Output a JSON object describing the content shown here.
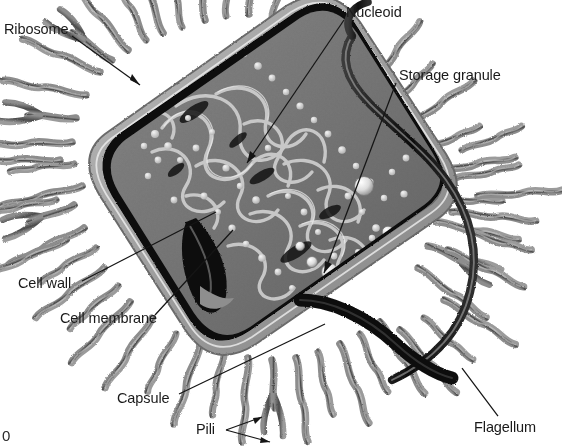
{
  "figure": {
    "background_color": "#ffffff",
    "ink_color": "#1a1a1a",
    "corner_mark": "0"
  },
  "labels": [
    {
      "id": "ribosome",
      "text": "Ribosome",
      "x": 4,
      "y": 22,
      "leader": {
        "x1": 72,
        "y1": 36,
        "x2": 140,
        "y2": 85
      },
      "arrow": true
    },
    {
      "id": "nucleoid",
      "text": "Nucleoid",
      "x": 346,
      "y": 5,
      "leader": {
        "x1": 344,
        "y1": 20,
        "x2": 247,
        "y2": 163
      },
      "arrow": true
    },
    {
      "id": "storage-granule",
      "text": "Storage granule",
      "x": 399,
      "y": 68,
      "leader": {
        "x1": 396,
        "y1": 83,
        "x2": 324,
        "y2": 273
      },
      "arrow": true
    },
    {
      "id": "cell-wall",
      "text": "Cell wall",
      "x": 18,
      "y": 276,
      "leader": {
        "x1": 82,
        "y1": 281,
        "x2": 216,
        "y2": 212
      },
      "arrow": false
    },
    {
      "id": "cell-membrane",
      "text": "Cell membrane",
      "x": 60,
      "y": 311,
      "leader": {
        "x1": 155,
        "y1": 315,
        "x2": 233,
        "y2": 230
      },
      "arrow": false
    },
    {
      "id": "capsule",
      "text": "Capsule",
      "x": 117,
      "y": 391,
      "leader": {
        "x1": 179,
        "y1": 394,
        "x2": 325,
        "y2": 324
      },
      "arrow": false
    },
    {
      "id": "pili",
      "text": "Pili",
      "x": 196,
      "y": 422,
      "leader": {
        "x1": 226,
        "y1": 430,
        "x2": 262,
        "y2": 418
      },
      "leader2": {
        "x1": 226,
        "y1": 430,
        "x2": 270,
        "y2": 442
      },
      "arrow": true
    },
    {
      "id": "flagellum",
      "text": "Flagellum",
      "x": 474,
      "y": 420,
      "leader": {
        "x1": 498,
        "y1": 416,
        "x2": 462,
        "y2": 368
      },
      "arrow": false
    }
  ],
  "structures": {
    "cell_body": "diagonal rod / capsule shape running upper-left to lower-right",
    "cell_wall": "thick black outline around the cytoplasm",
    "cell_membrane": "thin gray line just inside the cell wall",
    "capsule": "banded gray layer outside the cell wall",
    "cytoplasm": "mid-gray granular interior",
    "nucleoid": "tangled pale DNA fibrils in the cell centre",
    "ribosomes": "small bright dots scattered through the cytoplasm",
    "storage_granules": "larger white spheres near the right pole",
    "pili_count": 46,
    "flagellum": "single long thick wavy filament leaving the right pole and looping over the top-right"
  }
}
